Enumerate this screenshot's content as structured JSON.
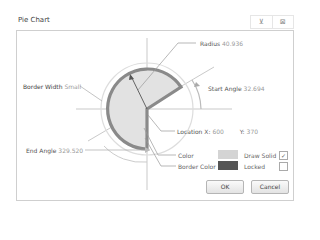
{
  "window": {
    "title": "Pie Chart",
    "icons": [
      {
        "name": "pin-icon",
        "glyph": "⊻"
      },
      {
        "name": "maximize-icon",
        "glyph": "⊠"
      }
    ]
  },
  "diagram": {
    "radius": {
      "label": "Radius",
      "value": "40.936"
    },
    "start_angle": {
      "label": "Start Angle",
      "value": "32.694"
    },
    "border_width": {
      "label": "Border Width",
      "value": "Small"
    },
    "end_angle": {
      "label": "End Angle",
      "value": "329.520"
    },
    "location": {
      "label": "Location",
      "x_label": "X:",
      "x_value": "600",
      "y_label": "Y:",
      "y_value": "370"
    },
    "color": {
      "label": "Color",
      "hex": "#d4d4d4"
    },
    "border_color": {
      "label": "Border Color",
      "hex": "#555555"
    },
    "draw_solid": {
      "label": "Draw Solid",
      "checked": true,
      "mark": "✓"
    },
    "locked": {
      "label": "Locked",
      "checked": false,
      "mark": ""
    }
  },
  "buttons": {
    "ok": "OK",
    "cancel": "Cancel"
  }
}
